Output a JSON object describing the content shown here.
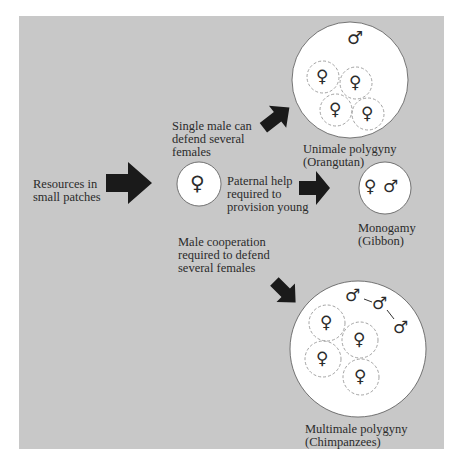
{
  "diagram": {
    "start": {
      "label_line1": "Resources in",
      "label_line2": "small patches"
    },
    "center_node": {
      "symbol": "♀",
      "meaning": "female"
    },
    "branches": [
      {
        "condition_line1": "Single male can",
        "condition_line2": "defend several",
        "condition_line3": "females",
        "outcome_line1": "Unimale polygyny",
        "outcome_line2": "(Orangutan)",
        "males": 1,
        "females": 4
      },
      {
        "condition_line1": "Paternal help",
        "condition_line2": "required to",
        "condition_line3": "provision young",
        "outcome_line1": "Monogamy",
        "outcome_line2": "(Gibbon)",
        "males": 1,
        "females": 1
      },
      {
        "condition_line1": "Male cooperation",
        "condition_line2": "required to defend",
        "condition_line3": "several females",
        "outcome_line1": "Multimale polygyny",
        "outcome_line2": "(Chimpanzees)",
        "males": 3,
        "females": 4
      }
    ],
    "symbols": {
      "female": "♀",
      "male": "♂"
    },
    "colors": {
      "panel": "#c8c8c8",
      "circle_fill": "#ffffff",
      "arrow": "#1a1a1a",
      "text": "#2b2b2b",
      "dashed": "#8a8a8a"
    }
  }
}
